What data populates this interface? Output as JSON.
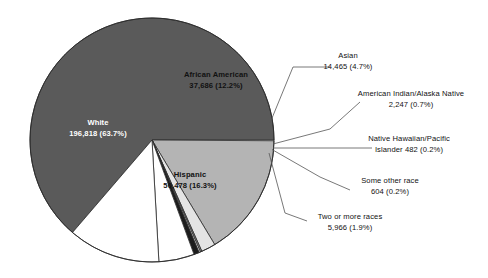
{
  "chart_data": {
    "type": "pie",
    "title": "",
    "subtitle": "",
    "legend_position": "callout-labels",
    "grid": false,
    "total": 308760,
    "categories": [
      "White",
      "African American",
      "Asian",
      "American Indian/Alaska Native",
      "Native Hawaiian/Pacific Islander",
      "Some other race",
      "Two or more races",
      "Hispanic"
    ],
    "values": [
      196818,
      37686,
      14465,
      2247,
      482,
      604,
      5966,
      50478
    ],
    "percents": [
      63.7,
      12.2,
      4.7,
      0.7,
      0.2,
      0.2,
      1.9,
      16.3
    ],
    "slices": [
      {
        "key": "white",
        "name": "White",
        "value": "196,818",
        "percent": "(63.7%)",
        "value_line": "196,818 (63.7%)",
        "raw_value": 196818,
        "raw_percent": 63.7,
        "color": "#5a5a5a",
        "label_placement": "inside",
        "label_color": "#ffffff"
      },
      {
        "key": "african-american",
        "name": "African American",
        "value": "37,686",
        "percent": "(12.2%)",
        "value_line": "37,686 (12.2%)",
        "raw_value": 37686,
        "raw_percent": 12.2,
        "color": "#ffffff",
        "label_placement": "inside",
        "label_color": "#111111"
      },
      {
        "key": "asian",
        "name": "Asian",
        "value": "14,465",
        "percent": "(4.7%)",
        "value_line": "14,465 (4.7%)",
        "raw_value": 14465,
        "raw_percent": 4.7,
        "color": "#ffffff",
        "label_placement": "callout",
        "label_color": "#111111"
      },
      {
        "key": "american-indian-alaska-native",
        "name": "American Indian/Alaska Native",
        "value": "2,247",
        "percent": "(0.7%)",
        "value_line": "2,247 (0.7%)",
        "raw_value": 2247,
        "raw_percent": 0.7,
        "color": "#1c1c1c",
        "label_placement": "callout",
        "label_color": "#111111"
      },
      {
        "key": "native-hawaiian-pacific-islander",
        "name": "Native Hawaiian/Pacific",
        "name_line2": "Islander  482 (0.2%)",
        "value": "482",
        "percent": "(0.2%)",
        "value_line": "Islander  482 (0.2%)",
        "raw_value": 482,
        "raw_percent": 0.2,
        "color": "#efefef",
        "label_placement": "callout",
        "label_color": "#111111"
      },
      {
        "key": "some-other-race",
        "name": "Some other race",
        "value": "604",
        "percent": "(0.2%)",
        "value_line": "604 (0.2%)",
        "raw_value": 604,
        "raw_percent": 0.2,
        "color": "#8f8f8f",
        "label_placement": "callout",
        "label_color": "#111111"
      },
      {
        "key": "two-or-more-races",
        "name": "Two or more races",
        "value": "5,966",
        "percent": "(1.9%)",
        "value_line": "5,966 (1.9%)",
        "raw_value": 5966,
        "raw_percent": 1.9,
        "color": "#e4e4e4",
        "label_placement": "callout",
        "label_color": "#111111"
      },
      {
        "key": "hispanic",
        "name": "Hispanic",
        "value": "50,478",
        "percent": "(16.3%)",
        "value_line": "50,478 (16.3%)",
        "raw_value": 50478,
        "raw_percent": 16.3,
        "color": "#b4b4b4",
        "label_placement": "inside",
        "label_color": "#111111"
      }
    ]
  },
  "colors": {
    "white_slice": "#5a5a5a",
    "african_american_slice": "#ffffff",
    "asian_slice": "#ffffff",
    "american_indian_slice": "#1c1c1c",
    "native_hawaiian_slice": "#efefef",
    "some_other_race_slice": "#8f8f8f",
    "two_or_more_slice": "#e4e4e4",
    "hispanic_slice": "#b4b4b4",
    "outline": "#2b2b2b",
    "leader_line": "#555555",
    "background": "#ffffff"
  }
}
